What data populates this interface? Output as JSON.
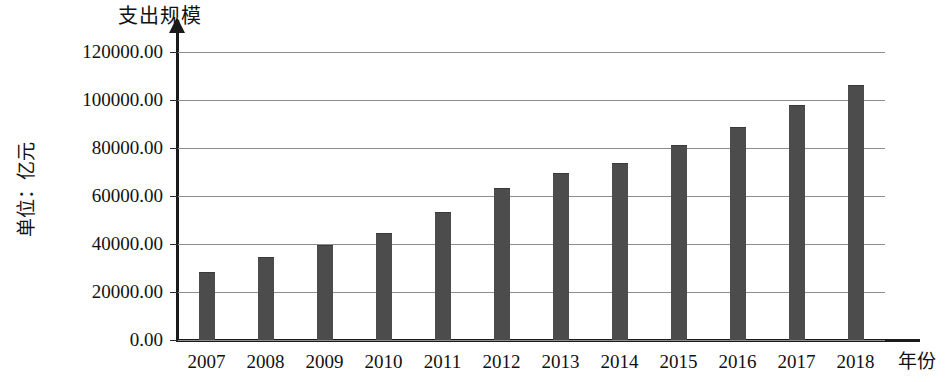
{
  "chart_data": {
    "type": "bar",
    "title": "支出规模",
    "subtitle": "",
    "xlabel": "年份",
    "ylabel": "单位：亿元",
    "categories": [
      "2007",
      "2008",
      "2009",
      "2010",
      "2011",
      "2012",
      "2013",
      "2014",
      "2015",
      "2016",
      "2017",
      "2018"
    ],
    "values": [
      28000,
      34000,
      39000,
      44000,
      53000,
      63000,
      69000,
      73500,
      81000,
      88500,
      97500,
      106000
    ],
    "series": [
      {
        "name": "支出规模",
        "values": [
          28000,
          34000,
          39000,
          44000,
          53000,
          63000,
          69000,
          73500,
          81000,
          88500,
          97500,
          106000
        ]
      }
    ],
    "ylim": [
      0,
      120000
    ],
    "ytick_values": [
      0,
      20000,
      40000,
      60000,
      80000,
      100000,
      120000
    ],
    "ytick_labels": [
      "0.00",
      "20000.00",
      "40000.00",
      "60000.00",
      "80000.00",
      "100000.00",
      "120000.00"
    ],
    "grid": true,
    "grid_axis": "y",
    "legend": false,
    "legend_position": "none",
    "bar_color": "#4c4c4c",
    "gridline_color": "#8d8d8d",
    "axis_color": "#1a1a1a",
    "background_color": "#ffffff"
  }
}
